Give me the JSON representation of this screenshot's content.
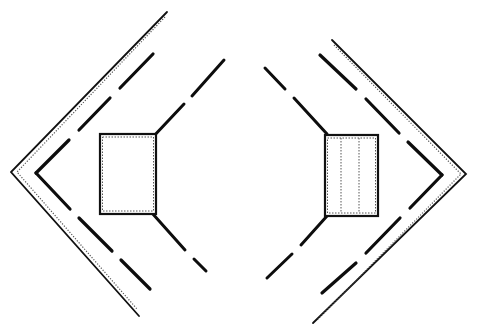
{
  "diagram": {
    "colors": {
      "stroke": "#111111",
      "dotted": "#555555",
      "background": "#ffffff"
    },
    "left_group": {
      "outer_chevron": [
        [
          167,
          12
        ],
        [
          11,
          172
        ],
        [
          139,
          316
        ]
      ],
      "inner_dashed_chevron": [
        [
          153,
          54
        ],
        [
          36,
          173
        ],
        [
          150,
          289
        ]
      ],
      "connector_top": [
        [
          156,
          134
        ],
        [
          224,
          60
        ]
      ],
      "connector_bottom": [
        [
          156,
          214
        ],
        [
          206,
          273
        ]
      ],
      "panel": {
        "x": 100,
        "y": 134,
        "w": 56,
        "h": 80,
        "inner_dividers": []
      }
    },
    "right_group": {
      "outer_chevron": [
        [
          332,
          40
        ],
        [
          466,
          174
        ],
        [
          313,
          323
        ]
      ],
      "inner_dashed_chevron": [
        [
          320,
          55
        ],
        [
          442,
          175
        ],
        [
          322,
          293
        ]
      ],
      "connector_top": [
        [
          265,
          68
        ],
        [
          327,
          135
        ]
      ],
      "connector_bottom": [
        [
          325,
          216
        ],
        [
          267,
          278
        ]
      ],
      "panel": {
        "x": 325,
        "y": 135,
        "w": 53,
        "h": 81,
        "inner_dividers": [
          341,
          359
        ]
      }
    }
  }
}
